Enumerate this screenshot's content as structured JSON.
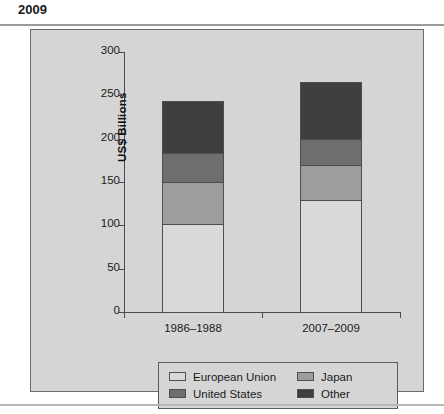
{
  "title": "2009",
  "chart_data": {
    "type": "bar",
    "subtype": "stacked",
    "title": "2009",
    "xlabel": "",
    "ylabel": "US$ Billions",
    "ylim": [
      0,
      300
    ],
    "yticks": [
      0,
      50,
      100,
      150,
      200,
      250,
      300
    ],
    "ytick_labels": [
      "0",
      "50",
      "100",
      "150",
      "200",
      "250",
      "300"
    ],
    "grid": false,
    "legend_position": "bottom",
    "categories": [
      "1986–1988",
      "2007–2009"
    ],
    "series": [
      {
        "name": "European Union",
        "color": "#d9d9d9",
        "values": [
          102,
          129
        ]
      },
      {
        "name": "Japan",
        "color": "#9d9d9d",
        "values": [
          48,
          41
        ]
      },
      {
        "name": "United States",
        "color": "#6e6e6e",
        "values": [
          34,
          30
        ]
      },
      {
        "name": "Other",
        "color": "#3f3f3f",
        "values": [
          60,
          65
        ]
      }
    ],
    "totals": [
      244,
      265
    ]
  },
  "legend": {
    "entries": [
      {
        "label": "European Union",
        "color": "#d9d9d9"
      },
      {
        "label": "Japan",
        "color": "#9d9d9d"
      },
      {
        "label": "United States",
        "color": "#6e6e6e"
      },
      {
        "label": "Other",
        "color": "#3f3f3f"
      }
    ]
  },
  "colors": {
    "panel_background": "#d5d5d5",
    "panel_border": "#6b6b6b",
    "axis": "#4a4a4a",
    "text": "#1a1a1a"
  }
}
